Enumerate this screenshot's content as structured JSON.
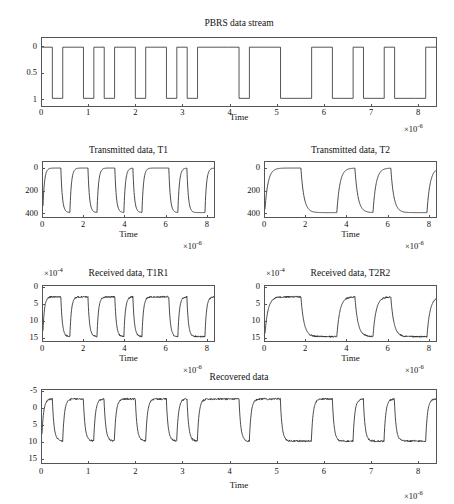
{
  "figure": {
    "background": "#ffffff",
    "line_color": "#2b2b2b",
    "axis_color": "#555555"
  },
  "panels": [
    {
      "id": "pbrs",
      "title": "PBRS data stream",
      "xlabel": "Time",
      "x_exponent": "×10",
      "x_exponent_sup": "-6",
      "y_exponent": "",
      "y_exponent_sup": "",
      "yticks": [
        "1",
        "0.5",
        "0"
      ],
      "xticks": [
        "0",
        "1",
        "2",
        "3",
        "4",
        "5",
        "6",
        "7",
        "8"
      ]
    },
    {
      "id": "t1",
      "title": "Transmitted data, T1",
      "xlabel": "Time",
      "x_exponent": "×10",
      "x_exponent_sup": "-6",
      "y_exponent": "",
      "y_exponent_sup": "",
      "yticks": [
        "400",
        "200",
        "0"
      ],
      "xticks": [
        "0",
        "2",
        "4",
        "6",
        "8"
      ]
    },
    {
      "id": "t2",
      "title": "Transmitted data, T2",
      "xlabel": "Time",
      "x_exponent": "×10",
      "x_exponent_sup": "-6",
      "y_exponent": "",
      "y_exponent_sup": "",
      "yticks": [
        "400",
        "200",
        "0"
      ],
      "xticks": [
        "0",
        "2",
        "4",
        "6",
        "8"
      ]
    },
    {
      "id": "t1r1",
      "title": "Received data, T1R1",
      "xlabel": "Time",
      "x_exponent": "×10",
      "x_exponent_sup": "-6",
      "y_exponent": "×10",
      "y_exponent_sup": "-4",
      "yticks": [
        "15",
        "10",
        "5",
        "0"
      ],
      "xticks": [
        "0",
        "2",
        "4",
        "6",
        "8"
      ]
    },
    {
      "id": "t2r2",
      "title": "Received data, T2R2",
      "xlabel": "Time",
      "x_exponent": "×10",
      "x_exponent_sup": "-6",
      "y_exponent": "×10",
      "y_exponent_sup": "-4",
      "yticks": [
        "15",
        "10",
        "5",
        "0"
      ],
      "xticks": [
        "0",
        "2",
        "4",
        "6",
        "8"
      ]
    },
    {
      "id": "recovered",
      "title": "Recovered data",
      "xlabel": "Time",
      "x_exponent": "×10",
      "x_exponent_sup": "-6",
      "y_exponent": "",
      "y_exponent_sup": "",
      "yticks": [
        "15",
        "10",
        "5",
        "0",
        "-5"
      ],
      "xticks": [
        "0",
        "1",
        "2",
        "3",
        "4",
        "5",
        "6",
        "7",
        "8"
      ]
    }
  ],
  "chart_data": [
    {
      "type": "line",
      "id": "pbrs",
      "title": "PBRS data stream",
      "xlabel": "Time",
      "ylabel": "",
      "x_scale_factor": 1e-06,
      "y_scale_factor": 1,
      "xlim": [
        0,
        8.4
      ],
      "ylim": [
        -0.15,
        1.18
      ],
      "xticks": [
        0,
        1,
        2,
        3,
        4,
        5,
        6,
        7,
        8
      ],
      "yticks": [
        0,
        0.5,
        1
      ],
      "grid": false,
      "legend": null,
      "waveform": "digital-nrz",
      "bit_period_us": 0.2211,
      "bits": [
        1,
        0,
        1,
        1,
        0,
        1,
        0,
        1,
        1,
        0,
        1,
        1,
        0,
        1,
        0,
        1,
        1,
        1,
        1,
        0,
        1,
        1,
        1,
        0,
        0,
        0,
        1,
        1,
        0,
        0,
        1,
        0,
        0,
        1,
        0,
        0,
        0,
        1
      ],
      "series": [
        {
          "name": "PBRS",
          "description": "Binary NRZ pseudo-random bit sequence, levels 0 and 1, sharp vertical transitions"
        }
      ]
    },
    {
      "type": "line",
      "id": "t1",
      "title": "Transmitted data, T1",
      "xlabel": "Time",
      "ylabel": "",
      "x_scale_factor": 1e-06,
      "y_scale_factor": 1,
      "xlim": [
        0,
        8.4
      ],
      "ylim": [
        -40,
        460
      ],
      "xticks": [
        0,
        2,
        4,
        6,
        8
      ],
      "yticks": [
        0,
        200,
        400
      ],
      "grid": false,
      "legend": null,
      "waveform": "filtered-nrz",
      "high_level": 405,
      "low_level": 0,
      "bit_period_us": 0.4422,
      "bits": [
        1,
        1,
        0,
        1,
        1,
        0,
        1,
        1,
        0,
        1,
        0,
        1,
        1,
        1,
        0,
        1,
        0,
        0,
        1,
        1
      ],
      "series": [
        {
          "name": "T1",
          "description": "Exponentially smoothed two-level drive waveform, 0 to ~405, rounded rise and fall edges"
        }
      ]
    },
    {
      "type": "line",
      "id": "t2",
      "title": "Transmitted data, T2",
      "xlabel": "Time",
      "ylabel": "",
      "x_scale_factor": 1e-06,
      "y_scale_factor": 1,
      "xlim": [
        0,
        8.4
      ],
      "ylim": [
        -40,
        460
      ],
      "xticks": [
        0,
        2,
        4,
        6,
        8
      ],
      "yticks": [
        0,
        200,
        400
      ],
      "grid": false,
      "legend": null,
      "waveform": "filtered-nrz",
      "high_level": 405,
      "low_level": 0,
      "bit_period_us": 0.8844,
      "bits": [
        1,
        1,
        0,
        0,
        1,
        0,
        1,
        0,
        0,
        1
      ],
      "series": [
        {
          "name": "T2",
          "description": "Exponentially smoothed two-level drive waveform at half the symbol rate of T1"
        }
      ]
    },
    {
      "type": "line",
      "id": "t1r1",
      "title": "Received data, T1R1",
      "xlabel": "Time",
      "ylabel": "",
      "x_scale_factor": 1e-06,
      "y_scale_factor": 0.0001,
      "xlim": [
        0,
        8.4
      ],
      "ylim": [
        -1.2,
        15.5
      ],
      "xticks": [
        0,
        2,
        4,
        6,
        8
      ],
      "yticks": [
        0,
        5,
        10,
        15
      ],
      "grid": false,
      "legend": null,
      "waveform": "filtered-nrz-noisy",
      "high_level": 12.2,
      "low_level": 0.15,
      "noise_amplitude": 0.45,
      "bit_period_us": 0.4422,
      "bits": [
        1,
        1,
        0,
        1,
        1,
        0,
        1,
        1,
        0,
        1,
        0,
        1,
        1,
        1,
        0,
        1,
        0,
        0,
        1,
        1
      ],
      "series": [
        {
          "name": "T1R1",
          "description": "Received optical/electrical response of T1 with additive noise visible on plateaus"
        }
      ]
    },
    {
      "type": "line",
      "id": "t2r2",
      "title": "Received data, T2R2",
      "xlabel": "Time",
      "ylabel": "",
      "x_scale_factor": 1e-06,
      "y_scale_factor": 0.0001,
      "xlim": [
        0,
        8.4
      ],
      "ylim": [
        -1.2,
        15.5
      ],
      "xticks": [
        0,
        2,
        4,
        6,
        8
      ],
      "yticks": [
        0,
        5,
        10,
        15
      ],
      "grid": false,
      "legend": null,
      "waveform": "filtered-nrz-noisy",
      "high_level": 12.2,
      "low_level": 0.15,
      "noise_amplitude": 0.45,
      "bit_period_us": 0.8844,
      "bits": [
        1,
        1,
        0,
        0,
        1,
        0,
        1,
        0,
        0,
        1
      ],
      "series": [
        {
          "name": "T2R2",
          "description": "Received response of T2 with additive noise visible on plateaus"
        }
      ]
    },
    {
      "type": "line",
      "id": "recovered",
      "title": "Recovered data",
      "xlabel": "Time",
      "ylabel": "",
      "x_scale_factor": 1e-06,
      "y_scale_factor": 1,
      "xlim": [
        0,
        8.4
      ],
      "ylim": [
        -6.5,
        15.5
      ],
      "xticks": [
        0,
        1,
        2,
        3,
        4,
        5,
        6,
        7,
        8
      ],
      "yticks": [
        -5,
        0,
        5,
        10,
        15
      ],
      "grid": false,
      "legend": null,
      "waveform": "filtered-nrz-noisy",
      "high_level": 12.8,
      "low_level": 0.1,
      "noise_amplitude": 0.55,
      "bit_period_us": 0.2211,
      "bits": [
        1,
        0,
        1,
        1,
        0,
        1,
        0,
        1,
        1,
        0,
        1,
        1,
        0,
        1,
        0,
        1,
        1,
        1,
        1,
        0,
        1,
        1,
        1,
        0,
        0,
        0,
        1,
        1,
        0,
        0,
        1,
        0,
        0,
        1,
        0,
        0,
        0,
        1
      ],
      "series": [
        {
          "name": "Recovered",
          "description": "Demultiplexed recovered bit stream matching the original PBRS sequence, with noise"
        }
      ]
    }
  ]
}
